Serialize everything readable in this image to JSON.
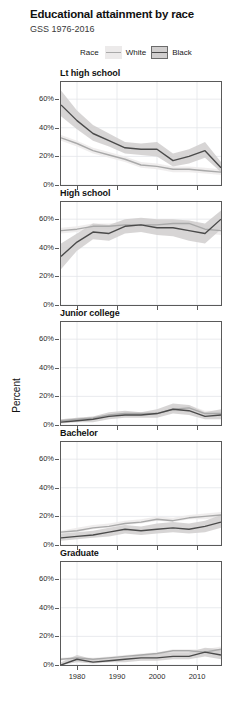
{
  "header": {
    "title": "Educational attainment by race",
    "subtitle": "GSS 1976-2016"
  },
  "legend": {
    "title": "Race",
    "items": [
      {
        "label": "White",
        "line_color": "#a9a9a9",
        "ribbon_color": "#eceaea"
      },
      {
        "label": "Black",
        "line_color": "#4a4a4a",
        "ribbon_color": "#d0cece"
      }
    ]
  },
  "axis": {
    "ylabel": "Percent",
    "yticks": [
      "0%",
      "20%",
      "40%",
      "60%"
    ],
    "ytick_values": [
      0,
      20,
      40,
      60
    ],
    "ylim": [
      0,
      72
    ],
    "xticks": [
      "1980",
      "1990",
      "2000",
      "2010"
    ],
    "xtick_values": [
      1980,
      1990,
      2000,
      2010
    ],
    "xlim": [
      1976,
      2016
    ],
    "grid": true
  },
  "chart_data": {
    "type": "line",
    "title": "Educational attainment by race",
    "subtitle": "GSS 1976-2016",
    "xlabel": "",
    "ylabel": "Percent",
    "ylim": [
      0,
      72
    ],
    "xlim": [
      1976,
      2016
    ],
    "grid": true,
    "legend_position": "top",
    "facet_variable": "Educational attainment",
    "x": [
      1976,
      1980,
      1984,
      1988,
      1992,
      1996,
      2000,
      2004,
      2008,
      2012,
      2016
    ],
    "panels": [
      {
        "name": "Lt high school",
        "series": [
          {
            "name": "White",
            "values": [
              33,
              29,
              24,
              21,
              18,
              14,
              13,
              11,
              11,
              10,
              9
            ],
            "lower": [
              31,
              27,
              22,
              19,
              16,
              12,
              11,
              9,
              9,
              8,
              7
            ],
            "upper": [
              35,
              31,
              26,
              23,
              20,
              16,
              15,
              13,
              13,
              12,
              11
            ]
          },
          {
            "name": "Black",
            "values": [
              56,
              45,
              36,
              31,
              26,
              25,
              25,
              17,
              20,
              24,
              12
            ],
            "lower": [
              48,
              39,
              31,
              27,
              22,
              21,
              20,
              13,
              15,
              19,
              9
            ],
            "upper": [
              66,
              52,
              42,
              36,
              30,
              29,
              30,
              22,
              25,
              30,
              16
            ]
          }
        ]
      },
      {
        "name": "High school",
        "series": [
          {
            "name": "White",
            "values": [
              52,
              53,
              55,
              55,
              56,
              56,
              56,
              57,
              57,
              53,
              52
            ],
            "lower": [
              50,
              51,
              53,
              53,
              54,
              54,
              54,
              55,
              55,
              50,
              49
            ],
            "upper": [
              54,
              55,
              57,
              57,
              58,
              58,
              58,
              59,
              59,
              56,
              55
            ]
          },
          {
            "name": "Black",
            "values": [
              34,
              44,
              51,
              50,
              55,
              56,
              54,
              54,
              52,
              50,
              60
            ],
            "lower": [
              25,
              38,
              46,
              45,
              50,
              51,
              49,
              48,
              45,
              43,
              53
            ],
            "upper": [
              43,
              50,
              57,
              56,
              60,
              61,
              60,
              60,
              59,
              57,
              66
            ]
          }
        ]
      },
      {
        "name": "Junior college",
        "series": [
          {
            "name": "White",
            "values": [
              3,
              4,
              5,
              7,
              8,
              8,
              8,
              11,
              12,
              8,
              8
            ],
            "lower": [
              2,
              3,
              4,
              6,
              7,
              7,
              7,
              9,
              10,
              7,
              6
            ],
            "upper": [
              4,
              5,
              6,
              8,
              9,
              9,
              9,
              13,
              14,
              10,
              10
            ]
          },
          {
            "name": "Black",
            "values": [
              2,
              3,
              4,
              6,
              7,
              7,
              8,
              11,
              10,
              6,
              7
            ],
            "lower": [
              1,
              2,
              2,
              4,
              5,
              5,
              5,
              8,
              7,
              4,
              4
            ],
            "upper": [
              4,
              5,
              6,
              9,
              10,
              9,
              11,
              15,
              14,
              9,
              11
            ]
          }
        ]
      },
      {
        "name": "Bachelor",
        "series": [
          {
            "name": "White",
            "values": [
              9,
              10,
              12,
              13,
              15,
              16,
              18,
              17,
              19,
              20,
              21
            ],
            "lower": [
              8,
              9,
              11,
              12,
              14,
              15,
              17,
              16,
              18,
              18,
              19
            ],
            "upper": [
              10,
              12,
              14,
              15,
              17,
              18,
              20,
              19,
              21,
              22,
              23
            ]
          },
          {
            "name": "Black",
            "values": [
              5,
              6,
              7,
              9,
              11,
              10,
              11,
              12,
              11,
              13,
              16
            ],
            "lower": [
              3,
              4,
              5,
              6,
              8,
              7,
              8,
              9,
              8,
              9,
              12
            ],
            "upper": [
              8,
              9,
              10,
              12,
              14,
              13,
              15,
              16,
              15,
              17,
              21
            ]
          }
        ]
      },
      {
        "name": "Graduate",
        "series": [
          {
            "name": "White",
            "values": [
              4,
              5,
              4,
              5,
              6,
              7,
              8,
              10,
              10,
              9,
              11
            ],
            "lower": [
              3,
              4,
              3,
              4,
              5,
              6,
              7,
              9,
              9,
              8,
              9
            ],
            "upper": [
              5,
              6,
              5,
              6,
              7,
              8,
              9,
              11,
              11,
              11,
              13
            ]
          },
          {
            "name": "Black",
            "values": [
              0,
              4,
              2,
              3,
              4,
              5,
              5,
              6,
              6,
              9,
              7
            ],
            "lower": [
              0,
              2,
              1,
              2,
              2,
              3,
              3,
              4,
              4,
              6,
              4
            ],
            "upper": [
              2,
              7,
              4,
              5,
              6,
              7,
              8,
              9,
              9,
              12,
              11
            ]
          }
        ]
      }
    ]
  }
}
